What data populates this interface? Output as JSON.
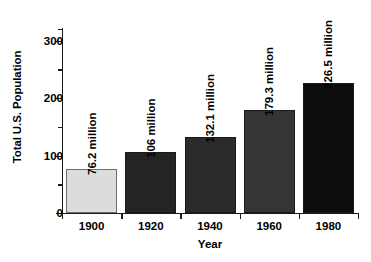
{
  "chart_data": {
    "type": "bar",
    "title": "",
    "xlabel": "Year",
    "ylabel": "Total U.S. Population",
    "categories": [
      "1900",
      "1920",
      "1940",
      "1960",
      "1980"
    ],
    "values": [
      76.2,
      106,
      132.1,
      179.3,
      226.5
    ],
    "data_labels": [
      "76.2 million",
      "106 million",
      "132.1 million",
      "179.3 million",
      "226.5 million"
    ],
    "bar_colors": [
      "#dcdcdc",
      "#242424",
      "#2b2b2b",
      "#353535",
      "#0d0d0d"
    ],
    "bar_edge_colors": [
      "#6e6e6e",
      "#1a1a1a",
      "#1a1a1a",
      "#1a1a1a",
      "#1a1a1a"
    ],
    "ylim": [
      0,
      320
    ],
    "yticks_major": [
      0,
      100,
      200,
      300
    ],
    "ytick_labels": [
      "0",
      "100",
      "200",
      "300"
    ],
    "yticks_minor": [
      50,
      150,
      250,
      320
    ],
    "grid": false,
    "legend": null,
    "units": "millions of people"
  },
  "figure": {
    "background_color": "#ffffff",
    "axis_color": "#1a1a1a",
    "text_color": "#000000"
  }
}
